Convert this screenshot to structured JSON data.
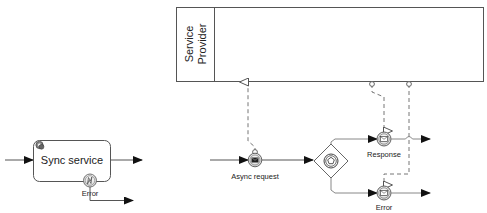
{
  "diagram": {
    "type": "BPMN",
    "pool": {
      "label_line1": "Service",
      "label_line2": "Provider"
    },
    "sync_task": {
      "label": "Sync service",
      "icon": "gear-icon",
      "boundary_event": {
        "label": "Error",
        "icon": "error-icon"
      }
    },
    "async_request": {
      "label": "Async request",
      "type": "intermediate-throw-message",
      "icon": "envelope-filled-icon"
    },
    "gateway": {
      "type": "event-based-gateway",
      "icon": "pentagon-icon"
    },
    "response_event": {
      "label": "Response",
      "type": "intermediate-catch-message",
      "icon": "envelope-icon"
    },
    "error_event": {
      "label": "Error",
      "type": "intermediate-catch-message",
      "icon": "envelope-icon"
    },
    "colors": {
      "stroke": "#555555",
      "text": "#222222",
      "fill_event": "#e6e6e6",
      "arrow": "#111111"
    }
  }
}
